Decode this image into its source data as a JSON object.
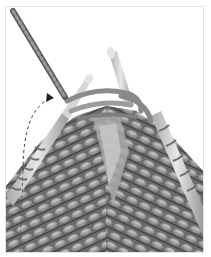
{
  "image": {
    "subject": "knitting-needles-with-yarn",
    "description": "Grayscale photo of knitting on needles: working yarn comes down from upper left to the right-hand needle, with a dashed curved arrow indicating the yarn wrap motion.",
    "colors": {
      "background": "#ffffff",
      "frame_border": "#e2e2e2",
      "yarn_dark": "#4a4a4a",
      "yarn_mid": "#7a7a7a",
      "yarn_light": "#b8b8b8",
      "needle": "#c9c9c9",
      "needle_highlight": "#e6e6e6",
      "arrow": "#333333"
    }
  }
}
